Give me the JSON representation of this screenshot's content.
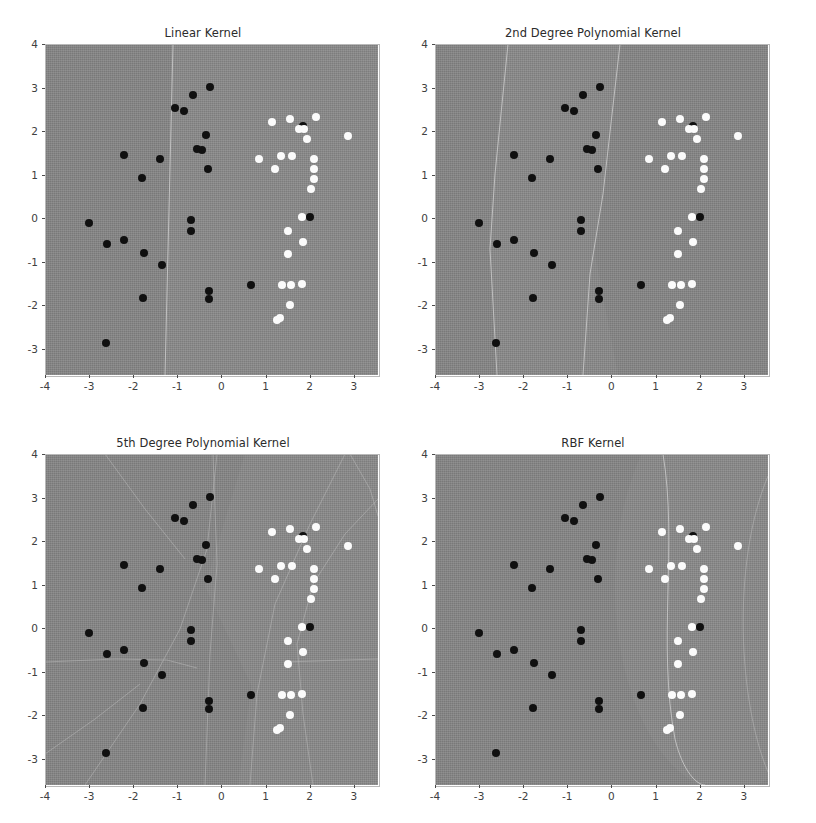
{
  "figure": {
    "width": 816,
    "height": 823,
    "background": "#ffffff",
    "layout": "2x2 grid of SVM decision-boundary scatter plots"
  },
  "axis": {
    "xticks": [
      "-4",
      "-3",
      "-2",
      "-1",
      "0",
      "1",
      "2",
      "3"
    ],
    "xtick_values": [
      -4,
      -3,
      -2,
      -1,
      0,
      1,
      2,
      3
    ],
    "yticks": [
      "4",
      "3",
      "2",
      "1",
      "0",
      "-1",
      "-2",
      "-3"
    ],
    "ytick_values": [
      4,
      3,
      2,
      1,
      0,
      -1,
      -2,
      -3
    ],
    "xlim": [
      -4.0,
      3.55
    ],
    "ylim": [
      -3.6,
      4.0
    ],
    "xlabel": "",
    "ylabel": "",
    "grid": false
  },
  "colors": {
    "class0": "#101010",
    "class1": "#fbfbfb",
    "region": "#878787",
    "boundary": "#c9c9c9",
    "text": "#2b2b2b"
  },
  "chart_data": [
    {
      "type": "scatter",
      "title": "Linear Kernel",
      "xlabel": "",
      "ylabel": "",
      "xlim": [
        -4.0,
        3.55
      ],
      "ylim": [
        -3.6,
        4.0
      ],
      "grid": false,
      "legend": "none",
      "series": [
        {
          "name": "class 0",
          "color": "#101010",
          "points": [
            [
              -0.25,
              3.02
            ],
            [
              -0.65,
              2.83
            ],
            [
              -1.05,
              2.54
            ],
            [
              -0.85,
              2.46
            ],
            [
              1.85,
              2.12
            ],
            [
              -0.35,
              1.92
            ],
            [
              -0.55,
              1.6
            ],
            [
              -0.45,
              1.57
            ],
            [
              -2.2,
              1.46
            ],
            [
              -1.4,
              1.35
            ],
            [
              -1.8,
              0.92
            ],
            [
              2.0,
              0.03
            ],
            [
              -0.3,
              1.14
            ],
            [
              -3.0,
              -0.1
            ],
            [
              -0.7,
              -0.05
            ],
            [
              -0.7,
              -0.3
            ],
            [
              -2.6,
              -0.6
            ],
            [
              -2.2,
              -0.5
            ],
            [
              -1.75,
              -0.79
            ],
            [
              -1.35,
              -1.07
            ],
            [
              0.68,
              -1.53
            ],
            [
              -0.28,
              -1.68
            ],
            [
              -0.28,
              -1.85
            ],
            [
              -1.78,
              -1.83
            ],
            [
              -2.62,
              -2.87
            ]
          ]
        },
        {
          "name": "class 1",
          "color": "#fbfbfb",
          "points": [
            [
              2.15,
              2.33
            ],
            [
              1.55,
              2.28
            ],
            [
              1.15,
              2.22
            ],
            [
              1.75,
              2.05
            ],
            [
              1.88,
              2.05
            ],
            [
              2.88,
              1.88
            ],
            [
              1.95,
              1.83
            ],
            [
              0.85,
              1.37
            ],
            [
              2.1,
              1.37
            ],
            [
              1.35,
              1.42
            ],
            [
              1.6,
              1.42
            ],
            [
              1.22,
              1.13
            ],
            [
              2.1,
              1.12
            ],
            [
              2.1,
              0.9
            ],
            [
              2.02,
              0.66
            ],
            [
              1.82,
              0.02
            ],
            [
              1.52,
              -0.3
            ],
            [
              1.85,
              -0.54
            ],
            [
              1.52,
              -0.83
            ],
            [
              1.38,
              -1.53
            ],
            [
              1.57,
              -1.53
            ],
            [
              1.82,
              -1.52
            ],
            [
              1.55,
              -2.0
            ],
            [
              1.25,
              -2.33
            ],
            [
              1.33,
              -2.3
            ]
          ]
        }
      ],
      "decision_regions": 2
    },
    {
      "type": "scatter",
      "title": "2nd Degree Polynomial Kernel",
      "xlabel": "",
      "ylabel": "",
      "xlim": [
        -4.0,
        3.55
      ],
      "ylim": [
        -3.6,
        4.0
      ],
      "grid": false,
      "legend": "none",
      "series": [
        {
          "name": "class 0",
          "color": "#101010",
          "points": [
            [
              -0.25,
              3.02
            ],
            [
              -0.65,
              2.83
            ],
            [
              -1.05,
              2.54
            ],
            [
              -0.85,
              2.46
            ],
            [
              1.85,
              2.12
            ],
            [
              -0.35,
              1.92
            ],
            [
              -0.55,
              1.6
            ],
            [
              -0.45,
              1.57
            ],
            [
              -2.2,
              1.46
            ],
            [
              -1.4,
              1.35
            ],
            [
              -1.8,
              0.92
            ],
            [
              2.0,
              0.03
            ],
            [
              -0.3,
              1.14
            ],
            [
              -3.0,
              -0.1
            ],
            [
              -0.7,
              -0.05
            ],
            [
              -0.7,
              -0.3
            ],
            [
              -2.6,
              -0.6
            ],
            [
              -2.2,
              -0.5
            ],
            [
              -1.75,
              -0.79
            ],
            [
              -1.35,
              -1.07
            ],
            [
              0.68,
              -1.53
            ],
            [
              -0.28,
              -1.68
            ],
            [
              -0.28,
              -1.85
            ],
            [
              -1.78,
              -1.83
            ],
            [
              -2.62,
              -2.87
            ]
          ]
        },
        {
          "name": "class 1",
          "color": "#fbfbfb",
          "points": [
            [
              2.15,
              2.33
            ],
            [
              1.55,
              2.28
            ],
            [
              1.15,
              2.22
            ],
            [
              1.75,
              2.05
            ],
            [
              1.88,
              2.05
            ],
            [
              2.88,
              1.88
            ],
            [
              1.95,
              1.83
            ],
            [
              0.85,
              1.37
            ],
            [
              2.1,
              1.37
            ],
            [
              1.35,
              1.42
            ],
            [
              1.6,
              1.42
            ],
            [
              1.22,
              1.13
            ],
            [
              2.1,
              1.12
            ],
            [
              2.1,
              0.9
            ],
            [
              2.02,
              0.66
            ],
            [
              1.82,
              0.02
            ],
            [
              1.52,
              -0.3
            ],
            [
              1.85,
              -0.54
            ],
            [
              1.52,
              -0.83
            ],
            [
              1.38,
              -1.53
            ],
            [
              1.57,
              -1.53
            ],
            [
              1.82,
              -1.52
            ],
            [
              1.55,
              -2.0
            ],
            [
              1.25,
              -2.33
            ],
            [
              1.33,
              -2.3
            ]
          ]
        }
      ],
      "decision_regions": 3
    },
    {
      "type": "scatter",
      "title": "5th Degree Polynomial Kernel",
      "xlabel": "",
      "ylabel": "",
      "xlim": [
        -4.0,
        3.55
      ],
      "ylim": [
        -3.6,
        4.0
      ],
      "grid": false,
      "legend": "none",
      "series": [
        {
          "name": "class 0",
          "color": "#101010",
          "points": [
            [
              -0.25,
              3.02
            ],
            [
              -0.65,
              2.83
            ],
            [
              -1.05,
              2.54
            ],
            [
              -0.85,
              2.46
            ],
            [
              1.85,
              2.12
            ],
            [
              -0.35,
              1.92
            ],
            [
              -0.55,
              1.6
            ],
            [
              -0.45,
              1.57
            ],
            [
              -2.2,
              1.46
            ],
            [
              -1.4,
              1.35
            ],
            [
              -1.8,
              0.92
            ],
            [
              2.0,
              0.03
            ],
            [
              -0.3,
              1.14
            ],
            [
              -3.0,
              -0.1
            ],
            [
              -0.7,
              -0.05
            ],
            [
              -0.7,
              -0.3
            ],
            [
              -2.6,
              -0.6
            ],
            [
              -2.2,
              -0.5
            ],
            [
              -1.75,
              -0.79
            ],
            [
              -1.35,
              -1.07
            ],
            [
              0.68,
              -1.53
            ],
            [
              -0.28,
              -1.68
            ],
            [
              -0.28,
              -1.85
            ],
            [
              -1.78,
              -1.83
            ],
            [
              -2.62,
              -2.87
            ]
          ]
        },
        {
          "name": "class 1",
          "color": "#fbfbfb",
          "points": [
            [
              2.15,
              2.33
            ],
            [
              1.55,
              2.28
            ],
            [
              1.15,
              2.22
            ],
            [
              1.75,
              2.05
            ],
            [
              1.88,
              2.05
            ],
            [
              2.88,
              1.88
            ],
            [
              1.95,
              1.83
            ],
            [
              0.85,
              1.37
            ],
            [
              2.1,
              1.37
            ],
            [
              1.35,
              1.42
            ],
            [
              1.6,
              1.42
            ],
            [
              1.22,
              1.13
            ],
            [
              2.1,
              1.12
            ],
            [
              2.1,
              0.9
            ],
            [
              2.02,
              0.66
            ],
            [
              1.82,
              0.02
            ],
            [
              1.52,
              -0.3
            ],
            [
              1.85,
              -0.54
            ],
            [
              1.52,
              -0.83
            ],
            [
              1.38,
              -1.53
            ],
            [
              1.57,
              -1.53
            ],
            [
              1.82,
              -1.52
            ],
            [
              1.55,
              -2.0
            ],
            [
              1.25,
              -2.33
            ],
            [
              1.33,
              -2.3
            ]
          ]
        }
      ],
      "decision_regions": "many (highly non-linear, fragmented)"
    },
    {
      "type": "scatter",
      "title": "RBF Kernel",
      "xlabel": "",
      "ylabel": "",
      "xlim": [
        -4.0,
        3.55
      ],
      "ylim": [
        -3.6,
        4.0
      ],
      "grid": false,
      "legend": "none",
      "series": [
        {
          "name": "class 0",
          "color": "#101010",
          "points": [
            [
              -0.25,
              3.02
            ],
            [
              -0.65,
              2.83
            ],
            [
              -1.05,
              2.54
            ],
            [
              -0.85,
              2.46
            ],
            [
              1.85,
              2.12
            ],
            [
              -0.35,
              1.92
            ],
            [
              -0.55,
              1.6
            ],
            [
              -0.45,
              1.57
            ],
            [
              -2.2,
              1.46
            ],
            [
              -1.4,
              1.35
            ],
            [
              -1.8,
              0.92
            ],
            [
              2.0,
              0.03
            ],
            [
              -0.3,
              1.14
            ],
            [
              -3.0,
              -0.1
            ],
            [
              -0.7,
              -0.05
            ],
            [
              -0.7,
              -0.3
            ],
            [
              -2.6,
              -0.6
            ],
            [
              -2.2,
              -0.5
            ],
            [
              -1.75,
              -0.79
            ],
            [
              -1.35,
              -1.07
            ],
            [
              0.68,
              -1.53
            ],
            [
              -0.28,
              -1.68
            ],
            [
              -0.28,
              -1.85
            ],
            [
              -1.78,
              -1.83
            ],
            [
              -2.62,
              -2.87
            ]
          ]
        },
        {
          "name": "class 1",
          "color": "#fbfbfb",
          "points": [
            [
              2.15,
              2.33
            ],
            [
              1.55,
              2.28
            ],
            [
              1.15,
              2.22
            ],
            [
              1.75,
              2.05
            ],
            [
              1.88,
              2.05
            ],
            [
              2.88,
              1.88
            ],
            [
              1.95,
              1.83
            ],
            [
              0.85,
              1.37
            ],
            [
              2.1,
              1.37
            ],
            [
              1.35,
              1.42
            ],
            [
              1.6,
              1.42
            ],
            [
              1.22,
              1.13
            ],
            [
              2.1,
              1.12
            ],
            [
              2.1,
              0.9
            ],
            [
              2.02,
              0.66
            ],
            [
              1.82,
              0.02
            ],
            [
              1.52,
              -0.3
            ],
            [
              1.85,
              -0.54
            ],
            [
              1.52,
              -0.83
            ],
            [
              1.38,
              -1.53
            ],
            [
              1.57,
              -1.53
            ],
            [
              1.82,
              -1.52
            ],
            [
              1.55,
              -2.0
            ],
            [
              1.25,
              -2.33
            ],
            [
              1.33,
              -2.3
            ]
          ]
        }
      ],
      "decision_regions": 2
    }
  ],
  "boundaries": {
    "linear": [
      "M 128,0 L 120,331"
    ],
    "poly2": [
      "M 73,0 L 55,200 L 62,331",
      "M 185,0 L 160,210 L 148,331"
    ],
    "poly5": [
      "M 300,0 L 250,120 L 205,331",
      "M 228,0 L 233,331",
      "M 0,208 L 120,206 L 150,214",
      "M 333,206 L 230,208",
      "M 44,331 L 130,180 L 165,130 L 175,0",
      "M 333,40 L 280,110 L 250,170 L 262,331",
      "M 312,0 L 333,60"
    ],
    "rbf": [
      "M 240,0 C 250,90 230,190 248,290 C 255,320 268,331 275,331",
      "M 333,25 C 300,120 310,260 333,320"
    ]
  }
}
